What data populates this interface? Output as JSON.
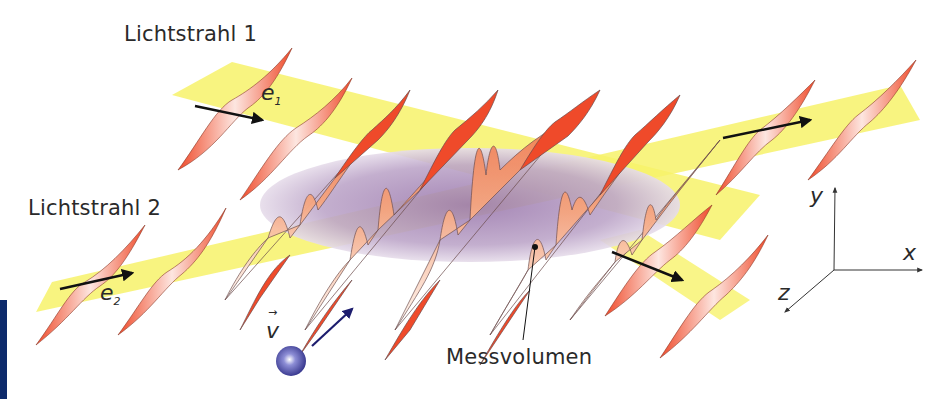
{
  "figure": {
    "labels": {
      "beam1": "Lichtstrahl 1",
      "beam2": "Lichtstrahl 2",
      "measurement_volume": "Messvolumen",
      "e1": "e",
      "e1_sub": "1",
      "e2": "e",
      "e2_sub": "2",
      "velocity": "v",
      "velocity_arrow": "→",
      "axis_x": "x",
      "axis_y": "y",
      "axis_z": "z"
    },
    "colors": {
      "beam_yellow": "#f7f26a",
      "wave_red": "#ef4a2a",
      "wave_light": "#fde6e0",
      "volume_purple": "#a889b8",
      "particle_blue": "#4a4aa8",
      "velocity_arrow": "#1d1d6e",
      "text": "#2a2a2a",
      "left_bar": "#0d2a6b"
    }
  }
}
